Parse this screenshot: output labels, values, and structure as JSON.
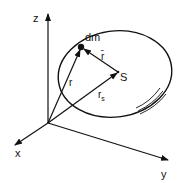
{
  "diagram": {
    "type": "vector-diagram",
    "colors": {
      "ink": "#111111",
      "background": "#ffffff"
    },
    "axes": {
      "z": {
        "label": "z"
      },
      "x": {
        "label": "x"
      },
      "y": {
        "label": "y"
      }
    },
    "points": {
      "mass_element": {
        "label": "dm"
      },
      "center_of_mass": {
        "label": "S"
      }
    },
    "vectors": {
      "r": {
        "label": "r",
        "from": "origin",
        "to": "dm"
      },
      "r_s": {
        "label": "r",
        "subscript": "s",
        "from": "origin",
        "to": "S"
      },
      "r_bar": {
        "label": "r̄",
        "from": "S",
        "to": "dm"
      }
    },
    "body": {
      "shape": "ellipse",
      "shading": "hatch-marks"
    }
  }
}
